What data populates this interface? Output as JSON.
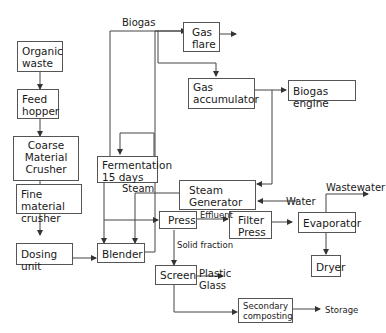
{
  "diagram": {
    "type": "process-flow",
    "nodes": {
      "organic_waste": "Organic\nwaste",
      "feed_hopper": "Feed\nhopper",
      "coarse_crusher": "Coarse\nMaterial\nCrusher",
      "fine_crusher": "Fine material\ncrusher",
      "dosing_unit": "Dosing unit",
      "fermentation": "Fermentation\n15 days",
      "blender": "Blender",
      "gas_flare": "Gas\nflare",
      "gas_accumulator": "Gas\naccumulator",
      "biogas_engine": "Biogas engine",
      "steam_generator": "Steam\nGenerator",
      "press": "Press",
      "filter_press": "Filter\nPress",
      "evaporator": "Evaporator",
      "dryer": "Dryer",
      "screen": "Screen",
      "secondary_composting": "Secondary\ncomposting"
    },
    "labels": {
      "biogas": "Biogas",
      "steam": "Steam",
      "water": "Water",
      "effluent": "Effluent",
      "wastewater": "Wastewater",
      "solid_fraction": "Solid fraction",
      "plastic": "Plastic",
      "glass": "Glass",
      "storage": "Storage"
    },
    "edges": [
      [
        "Organic waste",
        "Feed hopper"
      ],
      [
        "Feed hopper",
        "Coarse Material Crusher"
      ],
      [
        "Coarse Material Crusher",
        "Fine material crusher"
      ],
      [
        "Fine material crusher",
        "Dosing unit"
      ],
      [
        "Dosing unit",
        "Blender"
      ],
      [
        "Blender",
        "Fermentation 15 days"
      ],
      [
        "Fermentation 15 days",
        "Fermentation 15 days (recirculation)"
      ],
      [
        "Fermentation 15 days",
        "Biogas"
      ],
      [
        "Biogas",
        "Gas flare"
      ],
      [
        "Biogas",
        "Gas accumulator"
      ],
      [
        "Gas accumulator",
        "Biogas engine"
      ],
      [
        "Biogas engine",
        "Steam Generator"
      ],
      [
        "Water",
        "Steam Generator"
      ],
      [
        "Steam Generator",
        "Blender (Steam)"
      ],
      [
        "Fermentation 15 days",
        "Press"
      ],
      [
        "Press",
        "Filter Press (Effluent)"
      ],
      [
        "Filter Press",
        "Evaporator"
      ],
      [
        "Evaporator",
        "Wastewater"
      ],
      [
        "Evaporator",
        "Dryer"
      ],
      [
        "Press",
        "Screen (Solid fraction)"
      ],
      [
        "Screen",
        "Plastic / Glass"
      ],
      [
        "Screen",
        "Secondary composting"
      ],
      [
        "Secondary composting",
        "Storage"
      ]
    ]
  }
}
